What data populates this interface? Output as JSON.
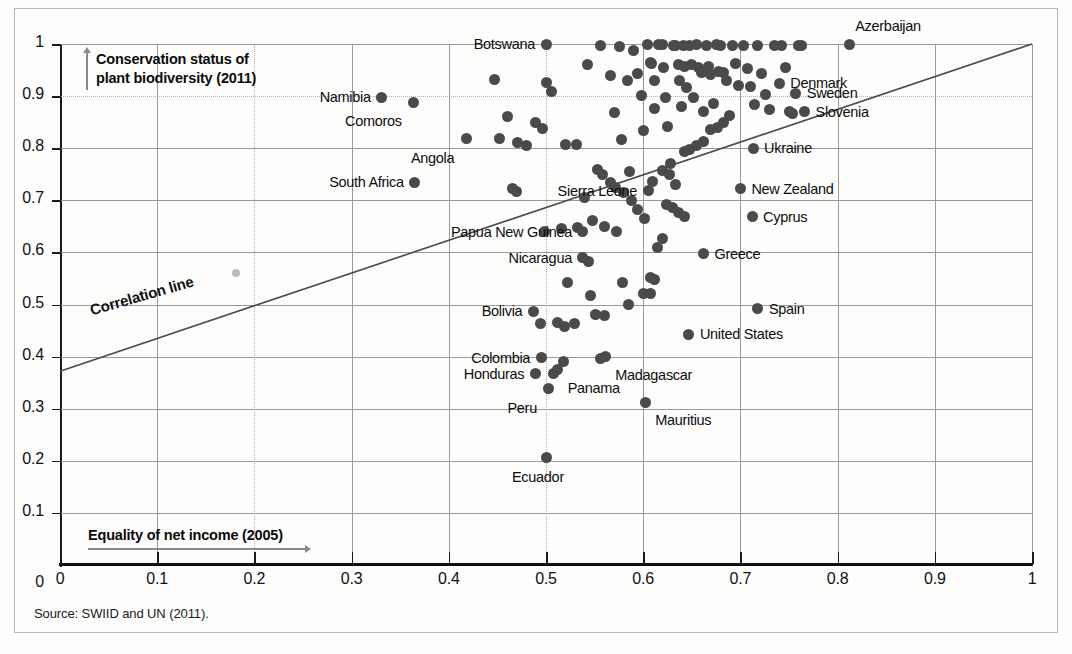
{
  "source_note": "Source: SWIID and UN (2011).",
  "axes": {
    "y_title": "Conservation status of plant biodiversity (2011)",
    "y_title_line1": "Conservation status of",
    "y_title_line2": "plant biodiversity (2011)",
    "x_title": "Equality of net income (2005)",
    "y_ticks": [
      "1",
      "0.9",
      "0.8",
      "0.7",
      "0.6",
      "0.5",
      "0.4",
      "0.3",
      "0.2",
      "0.1",
      "0"
    ],
    "x_ticks": [
      "0",
      "0.1",
      "0.2",
      "0.3",
      "0.4",
      "0.5",
      "0.6",
      "0.7",
      "0.8",
      "0.9",
      "1"
    ]
  },
  "legend": {
    "correlation_line_label": "Correlation line"
  },
  "colors": {
    "dot": "#4a4a4a",
    "grid": "#9a9a9a",
    "axis": "#111111",
    "text": "#0d0d0d",
    "frame": "#b9b9b9"
  },
  "chart_data": {
    "type": "scatter",
    "title": "",
    "xlabel": "Equality of net income (2005)",
    "ylabel": "Conservation status of plant biodiversity (2011)",
    "xlim": [
      0,
      1
    ],
    "ylim": [
      0,
      1
    ],
    "xticks": [
      0,
      0.1,
      0.2,
      0.3,
      0.4,
      0.5,
      0.6,
      0.7,
      0.8,
      0.9,
      1
    ],
    "yticks": [
      0,
      0.1,
      0.2,
      0.3,
      0.4,
      0.5,
      0.6,
      0.7,
      0.8,
      0.9,
      1
    ],
    "grid": true,
    "legend_position": "none",
    "annotations": [
      "Correlation line"
    ],
    "trendline": {
      "label": "Correlation line",
      "x0": 0.0,
      "y0": 0.372,
      "x1": 1.0,
      "y1": 1.0
    },
    "labeled_points": [
      {
        "name": "Botswana",
        "x": 0.5,
        "y": 1.0,
        "label_side": "left"
      },
      {
        "name": "Azerbaijan",
        "x": 0.812,
        "y": 1.0,
        "label_side": "above"
      },
      {
        "name": "Namibia",
        "x": 0.331,
        "y": 0.898,
        "label_side": "left"
      },
      {
        "name": "Comoros",
        "x": 0.364,
        "y": 0.888,
        "label_side": "below-left"
      },
      {
        "name": "Denmark",
        "x": 0.74,
        "y": 0.925,
        "label_side": "right"
      },
      {
        "name": "Sweden",
        "x": 0.757,
        "y": 0.905,
        "label_side": "right"
      },
      {
        "name": "Slovenia",
        "x": 0.766,
        "y": 0.87,
        "label_side": "right"
      },
      {
        "name": "Angola",
        "x": 0.418,
        "y": 0.818,
        "label_side": "below-left"
      },
      {
        "name": "South Africa",
        "x": 0.365,
        "y": 0.735,
        "label_side": "left"
      },
      {
        "name": "Ukraine",
        "x": 0.713,
        "y": 0.8,
        "label_side": "right"
      },
      {
        "name": "Sierra Leone",
        "x": 0.605,
        "y": 0.718,
        "label_side": "left"
      },
      {
        "name": "New Zealand",
        "x": 0.7,
        "y": 0.722,
        "label_side": "right"
      },
      {
        "name": "Cyprus",
        "x": 0.712,
        "y": 0.668,
        "label_side": "right"
      },
      {
        "name": "Papua New Guinea",
        "x": 0.538,
        "y": 0.64,
        "label_side": "left"
      },
      {
        "name": "Nicaragua",
        "x": 0.538,
        "y": 0.59,
        "label_side": "left"
      },
      {
        "name": "Greece",
        "x": 0.662,
        "y": 0.597,
        "label_side": "right"
      },
      {
        "name": "Bolivia",
        "x": 0.487,
        "y": 0.487,
        "label_side": "left"
      },
      {
        "name": "Spain",
        "x": 0.718,
        "y": 0.492,
        "label_side": "right"
      },
      {
        "name": "United States",
        "x": 0.647,
        "y": 0.443,
        "label_side": "right"
      },
      {
        "name": "Colombia",
        "x": 0.495,
        "y": 0.398,
        "label_side": "left"
      },
      {
        "name": "Madagascar",
        "x": 0.561,
        "y": 0.4,
        "label_side": "below-right"
      },
      {
        "name": "Honduras",
        "x": 0.489,
        "y": 0.367,
        "label_side": "left"
      },
      {
        "name": "Panama",
        "x": 0.512,
        "y": 0.375,
        "label_side": "below-right"
      },
      {
        "name": "Peru",
        "x": 0.503,
        "y": 0.338,
        "label_side": "below-left"
      },
      {
        "name": "Mauritius",
        "x": 0.602,
        "y": 0.312,
        "label_side": "below-right"
      },
      {
        "name": "Ecuador",
        "x": 0.5,
        "y": 0.207,
        "label_side": "below"
      }
    ],
    "unlabeled_points": [
      {
        "x": 0.181,
        "y": 0.56,
        "faint": true
      },
      {
        "x": 0.5,
        "y": 0.927
      },
      {
        "x": 0.506,
        "y": 0.908
      },
      {
        "x": 0.52,
        "y": 0.807
      },
      {
        "x": 0.531,
        "y": 0.808
      },
      {
        "x": 0.543,
        "y": 0.96
      },
      {
        "x": 0.556,
        "y": 0.998
      },
      {
        "x": 0.566,
        "y": 0.939
      },
      {
        "x": 0.57,
        "y": 0.868
      },
      {
        "x": 0.576,
        "y": 0.995
      },
      {
        "x": 0.578,
        "y": 0.817
      },
      {
        "x": 0.584,
        "y": 0.93
      },
      {
        "x": 0.586,
        "y": 0.755
      },
      {
        "x": 0.59,
        "y": 0.987
      },
      {
        "x": 0.594,
        "y": 0.944
      },
      {
        "x": 0.598,
        "y": 0.902
      },
      {
        "x": 0.6,
        "y": 0.834
      },
      {
        "x": 0.604,
        "y": 0.999
      },
      {
        "x": 0.607,
        "y": 0.965
      },
      {
        "x": 0.609,
        "y": 0.963
      },
      {
        "x": 0.612,
        "y": 0.93
      },
      {
        "x": 0.612,
        "y": 0.877
      },
      {
        "x": 0.616,
        "y": 0.999
      },
      {
        "x": 0.62,
        "y": 0.999
      },
      {
        "x": 0.621,
        "y": 0.954
      },
      {
        "x": 0.623,
        "y": 0.898
      },
      {
        "x": 0.625,
        "y": 0.841
      },
      {
        "x": 0.628,
        "y": 0.77
      },
      {
        "x": 0.631,
        "y": 0.998
      },
      {
        "x": 0.633,
        "y": 0.997
      },
      {
        "x": 0.636,
        "y": 0.96
      },
      {
        "x": 0.637,
        "y": 0.93
      },
      {
        "x": 0.639,
        "y": 0.88
      },
      {
        "x": 0.641,
        "y": 0.997
      },
      {
        "x": 0.643,
        "y": 0.956
      },
      {
        "x": 0.645,
        "y": 0.916
      },
      {
        "x": 0.648,
        "y": 0.998
      },
      {
        "x": 0.65,
        "y": 0.96
      },
      {
        "x": 0.652,
        "y": 0.897
      },
      {
        "x": 0.655,
        "y": 0.999
      },
      {
        "x": 0.657,
        "y": 0.954
      },
      {
        "x": 0.66,
        "y": 0.945
      },
      {
        "x": 0.662,
        "y": 0.87
      },
      {
        "x": 0.665,
        "y": 0.998
      },
      {
        "x": 0.667,
        "y": 0.957
      },
      {
        "x": 0.669,
        "y": 0.941
      },
      {
        "x": 0.672,
        "y": 0.886
      },
      {
        "x": 0.675,
        "y": 0.999
      },
      {
        "x": 0.677,
        "y": 0.947
      },
      {
        "x": 0.68,
        "y": 0.998
      },
      {
        "x": 0.683,
        "y": 0.945
      },
      {
        "x": 0.686,
        "y": 0.93
      },
      {
        "x": 0.689,
        "y": 0.862
      },
      {
        "x": 0.692,
        "y": 0.998
      },
      {
        "x": 0.695,
        "y": 0.962
      },
      {
        "x": 0.698,
        "y": 0.921
      },
      {
        "x": 0.703,
        "y": 0.998
      },
      {
        "x": 0.707,
        "y": 0.953
      },
      {
        "x": 0.71,
        "y": 0.918
      },
      {
        "x": 0.714,
        "y": 0.884
      },
      {
        "x": 0.718,
        "y": 0.998
      },
      {
        "x": 0.722,
        "y": 0.944
      },
      {
        "x": 0.726,
        "y": 0.903
      },
      {
        "x": 0.73,
        "y": 0.875
      },
      {
        "x": 0.735,
        "y": 0.997
      },
      {
        "x": 0.742,
        "y": 0.997
      },
      {
        "x": 0.746,
        "y": 0.955
      },
      {
        "x": 0.751,
        "y": 0.87
      },
      {
        "x": 0.754,
        "y": 0.867
      },
      {
        "x": 0.76,
        "y": 0.998
      },
      {
        "x": 0.763,
        "y": 0.998
      },
      {
        "x": 0.553,
        "y": 0.76
      },
      {
        "x": 0.558,
        "y": 0.75
      },
      {
        "x": 0.566,
        "y": 0.735
      },
      {
        "x": 0.572,
        "y": 0.725
      },
      {
        "x": 0.58,
        "y": 0.715
      },
      {
        "x": 0.588,
        "y": 0.7
      },
      {
        "x": 0.594,
        "y": 0.682
      },
      {
        "x": 0.601,
        "y": 0.665
      },
      {
        "x": 0.61,
        "y": 0.737
      },
      {
        "x": 0.62,
        "y": 0.757
      },
      {
        "x": 0.627,
        "y": 0.75
      },
      {
        "x": 0.633,
        "y": 0.73
      },
      {
        "x": 0.642,
        "y": 0.793
      },
      {
        "x": 0.648,
        "y": 0.797
      },
      {
        "x": 0.655,
        "y": 0.806
      },
      {
        "x": 0.662,
        "y": 0.812
      },
      {
        "x": 0.669,
        "y": 0.836
      },
      {
        "x": 0.676,
        "y": 0.84
      },
      {
        "x": 0.683,
        "y": 0.85
      },
      {
        "x": 0.624,
        "y": 0.692
      },
      {
        "x": 0.63,
        "y": 0.686
      },
      {
        "x": 0.636,
        "y": 0.676
      },
      {
        "x": 0.643,
        "y": 0.668
      },
      {
        "x": 0.615,
        "y": 0.61
      },
      {
        "x": 0.62,
        "y": 0.627
      },
      {
        "x": 0.607,
        "y": 0.552
      },
      {
        "x": 0.612,
        "y": 0.548
      },
      {
        "x": 0.6,
        "y": 0.522
      },
      {
        "x": 0.608,
        "y": 0.522
      },
      {
        "x": 0.579,
        "y": 0.542
      },
      {
        "x": 0.585,
        "y": 0.5
      },
      {
        "x": 0.546,
        "y": 0.517
      },
      {
        "x": 0.551,
        "y": 0.48
      },
      {
        "x": 0.56,
        "y": 0.478
      },
      {
        "x": 0.522,
        "y": 0.543
      },
      {
        "x": 0.512,
        "y": 0.466
      },
      {
        "x": 0.519,
        "y": 0.458
      },
      {
        "x": 0.529,
        "y": 0.463
      },
      {
        "x": 0.494,
        "y": 0.463
      },
      {
        "x": 0.518,
        "y": 0.39
      },
      {
        "x": 0.508,
        "y": 0.368
      },
      {
        "x": 0.556,
        "y": 0.397
      },
      {
        "x": 0.498,
        "y": 0.64
      },
      {
        "x": 0.516,
        "y": 0.645
      },
      {
        "x": 0.532,
        "y": 0.648
      },
      {
        "x": 0.54,
        "y": 0.705
      },
      {
        "x": 0.548,
        "y": 0.662
      },
      {
        "x": 0.56,
        "y": 0.65
      },
      {
        "x": 0.573,
        "y": 0.64
      },
      {
        "x": 0.544,
        "y": 0.582
      },
      {
        "x": 0.466,
        "y": 0.722
      },
      {
        "x": 0.47,
        "y": 0.716
      },
      {
        "x": 0.471,
        "y": 0.81
      },
      {
        "x": 0.48,
        "y": 0.806
      },
      {
        "x": 0.46,
        "y": 0.86
      },
      {
        "x": 0.447,
        "y": 0.932
      },
      {
        "x": 0.452,
        "y": 0.818
      },
      {
        "x": 0.489,
        "y": 0.85
      },
      {
        "x": 0.496,
        "y": 0.838
      }
    ]
  }
}
